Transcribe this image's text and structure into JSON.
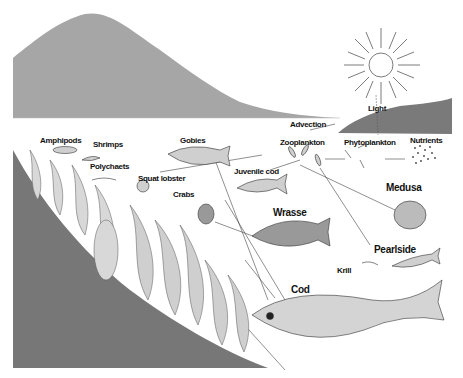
{
  "diagram": {
    "colors": {
      "mountain": "#a6a6a6",
      "shore_right": "#7a7a7a",
      "seabed": "#777777",
      "water": "#ffffff",
      "ink": "#111111"
    },
    "labels": {
      "light": "Light",
      "advection": "Advection",
      "zooplankton": "Zooplankton",
      "phytoplankton": "Phytoplankton",
      "nutrients": "Nutrients",
      "amphipods": "Amphipods",
      "shrimps": "Shrimps",
      "polychaets": "Polychaets",
      "gobies": "Gobies",
      "squat_lobster": "Squat lobster",
      "crabs": "Crabs",
      "juvenile_cod": "Juvenile cod",
      "medusa": "Medusa",
      "wrasse": "Wrasse",
      "pearlside": "Pearlside",
      "krill": "Krill",
      "cod": "Cod"
    },
    "nodes": [
      {
        "id": "light",
        "label": "Light"
      },
      {
        "id": "nutrients",
        "label": "Nutrients"
      },
      {
        "id": "phytoplankton",
        "label": "Phytoplankton"
      },
      {
        "id": "zooplankton",
        "label": "Zooplankton"
      },
      {
        "id": "advection",
        "label": "Advection"
      },
      {
        "id": "gobies",
        "label": "Gobies"
      },
      {
        "id": "juvenile_cod",
        "label": "Juvenile cod"
      },
      {
        "id": "amphipods",
        "label": "Amphipods"
      },
      {
        "id": "shrimps",
        "label": "Shrimps"
      },
      {
        "id": "polychaets",
        "label": "Polychaets"
      },
      {
        "id": "squat_lobster",
        "label": "Squat lobster"
      },
      {
        "id": "crabs",
        "label": "Crabs"
      },
      {
        "id": "wrasse",
        "label": "Wrasse"
      },
      {
        "id": "medusa",
        "label": "Medusa"
      },
      {
        "id": "pearlside",
        "label": "Pearlside"
      },
      {
        "id": "krill",
        "label": "Krill"
      },
      {
        "id": "cod",
        "label": "Cod"
      }
    ],
    "edges": [
      {
        "from": "light",
        "to": "phytoplankton"
      },
      {
        "from": "nutrients",
        "to": "phytoplankton"
      },
      {
        "from": "phytoplankton",
        "to": "zooplankton"
      },
      {
        "from": "zooplankton",
        "to": "advection"
      },
      {
        "from": "zooplankton",
        "to": "gobies"
      },
      {
        "from": "zooplankton",
        "to": "juvenile_cod"
      },
      {
        "from": "zooplankton",
        "to": "medusa"
      },
      {
        "from": "zooplankton",
        "to": "pearlside"
      },
      {
        "from": "gobies",
        "to": "cod"
      },
      {
        "from": "juvenile_cod",
        "to": "wrasse"
      },
      {
        "from": "wrasse",
        "to": "cod"
      },
      {
        "from": "crabs",
        "to": "cod"
      },
      {
        "from": "amphipods",
        "to": "cod"
      }
    ]
  }
}
